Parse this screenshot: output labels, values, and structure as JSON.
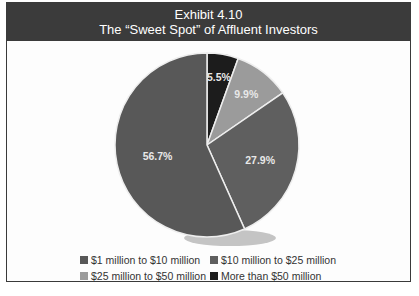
{
  "header": {
    "exhibit": "Exhibit 4.10",
    "title": "The “Sweet Spot” of Affluent Investors"
  },
  "chart_data": {
    "type": "pie",
    "title": "Exhibit 4.10 The “Sweet Spot” of Affluent Investors",
    "categories": [
      "More than $50 million",
      "$25 million to $50 million",
      "$10 million to $25 million",
      "$1 million to $10 million"
    ],
    "values": [
      5.5,
      9.9,
      27.9,
      56.7
    ],
    "labels": [
      "5.5%",
      "9.9%",
      "27.9%",
      "56.7%"
    ],
    "colors": [
      "#1c1c1c",
      "#9b9b9b",
      "#5f5f5f",
      "#585858"
    ],
    "start_angle": "12 o'clock",
    "direction": "clockwise",
    "legend_position": "bottom"
  },
  "legend": {
    "items": [
      {
        "label": "$1 million to $10 million",
        "color": "#585858"
      },
      {
        "label": "$10 million to $25 million",
        "color": "#5f5f5f"
      },
      {
        "label": "$25 million to $50 million",
        "color": "#9b9b9b"
      },
      {
        "label": "More than $50 million",
        "color": "#1c1c1c"
      }
    ]
  }
}
